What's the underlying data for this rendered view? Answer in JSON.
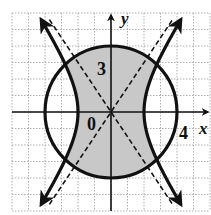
{
  "figure": {
    "type": "graph-of-system-of-inequalities",
    "axes": {
      "x_label": "x",
      "y_label": "y",
      "range_x": [
        -6,
        6
      ],
      "range_y": [
        -6,
        6
      ],
      "grid": true,
      "grid_style": "dotted"
    },
    "labels": {
      "origin": "0",
      "y_tick": "3",
      "x_tick": "4"
    },
    "curves": [
      {
        "name": "circle",
        "equation": "x^2 + y^2 = 16",
        "style": "solid",
        "radius": 4
      },
      {
        "name": "hyperbola",
        "equation": "x^2/4 - y^2/9 = 1",
        "style": "solid",
        "vertices": [
          [
            -2,
            0
          ],
          [
            2,
            0
          ]
        ]
      },
      {
        "name": "asymptote-1",
        "equation": "y = 1.5x",
        "style": "dashed"
      },
      {
        "name": "asymptote-2",
        "equation": "y = -1.5x",
        "style": "dashed"
      }
    ],
    "shaded_region": {
      "description": "inside circle and between hyperbola branches",
      "color": "#c8c8c8"
    },
    "colors": {
      "curve": "#111111",
      "grid": "#9a9a9a",
      "shade": "#c8c8c8"
    }
  }
}
